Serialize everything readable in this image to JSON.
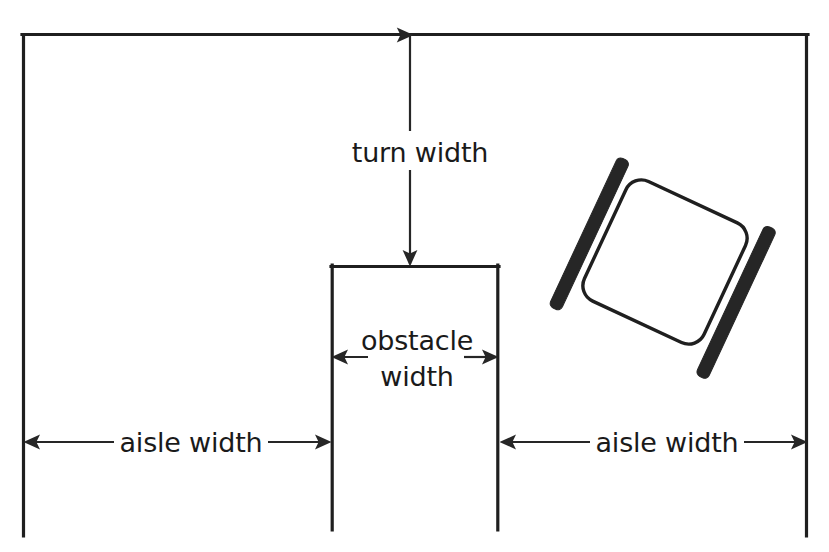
{
  "diagram": {
    "labels": {
      "turn_width": "turn width",
      "obstacle_width_line1": "obstacle",
      "obstacle_width_line2": "width",
      "aisle_width_left": "aisle width",
      "aisle_width_right": "aisle width"
    },
    "colors": {
      "ink": "#1f1f1f",
      "bar_fill": "#262626",
      "background": "#ffffff",
      "dimension_line": "#262626"
    },
    "geometry": {
      "frame": {
        "left_x": 22,
        "right_x": 808,
        "top_y": 33,
        "bottom_y": 537,
        "note": "open at bottom"
      },
      "obstacle": {
        "left_x": 331,
        "right_x": 499,
        "top_y": 265,
        "bottom_y": 530
      },
      "turn_width_arrow": {
        "x": 410,
        "from_y": 33,
        "to_y": 265
      },
      "obstacle_width_arrow": {
        "y": 357,
        "from_x": 331,
        "to_x": 499
      },
      "aisle_width_left_arrow": {
        "y": 442,
        "from_x": 24,
        "to_x": 331
      },
      "aisle_width_right_arrow": {
        "y": 442,
        "from_x": 500,
        "to_x": 807
      },
      "cart": {
        "center_x": 665,
        "center_y": 262,
        "size": 132,
        "rotation_deg": 25,
        "corner_radius": 16
      },
      "cart_bar_left": {
        "x1": 542,
        "y1": 231,
        "x2": 628,
        "y2": 378,
        "thickness": 13
      },
      "cart_bar_right": {
        "x1": 676,
        "y1": 146,
        "x2": 766,
        "y2": 292,
        "thickness": 13
      }
    }
  }
}
